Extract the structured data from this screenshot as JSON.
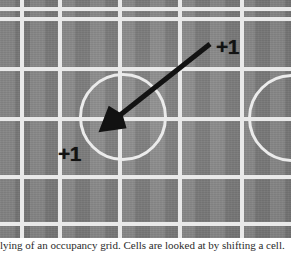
{
  "figure": {
    "kind": "annotated-pitch-grid",
    "width": 291,
    "height": 238,
    "colors": {
      "turf_light": "#8f8f8f",
      "turf_dark": "#7e7e7e",
      "grid_line": "#e9e9e9",
      "circle_line": "#ebebeb",
      "annotation": "#121212",
      "page_background": "#ffffff"
    },
    "grid": {
      "horizontal_lines_y": [
        7,
        17,
        67,
        117,
        175,
        222
      ],
      "vertical_lines_x": [
        20,
        58,
        118,
        178,
        240
      ],
      "line_thickness": 4,
      "stripe_period": 30
    },
    "circles": [
      {
        "name": "center-circle",
        "cx": 123,
        "cy": 117,
        "r": 44
      },
      {
        "name": "right-partial-circle",
        "cx": 292,
        "cy": 118,
        "r": 44
      }
    ],
    "arrow": {
      "name": "displacement-arrow",
      "from_x": 210,
      "from_y": 44,
      "to_x": 100,
      "to_y": 131,
      "stroke_width": 5,
      "head_length": 22,
      "color": "#121212"
    },
    "annotations": [
      {
        "name": "plus-one-source",
        "text": "+1",
        "x": 216,
        "y": 36
      },
      {
        "name": "plus-one-target",
        "text": "+1",
        "x": 58,
        "y": 143
      }
    ]
  },
  "caption": {
    "text": "lying of an occupancy grid. Cells are looked at by shifting a cell.",
    "visible_note": "clipped at frame bottom"
  }
}
